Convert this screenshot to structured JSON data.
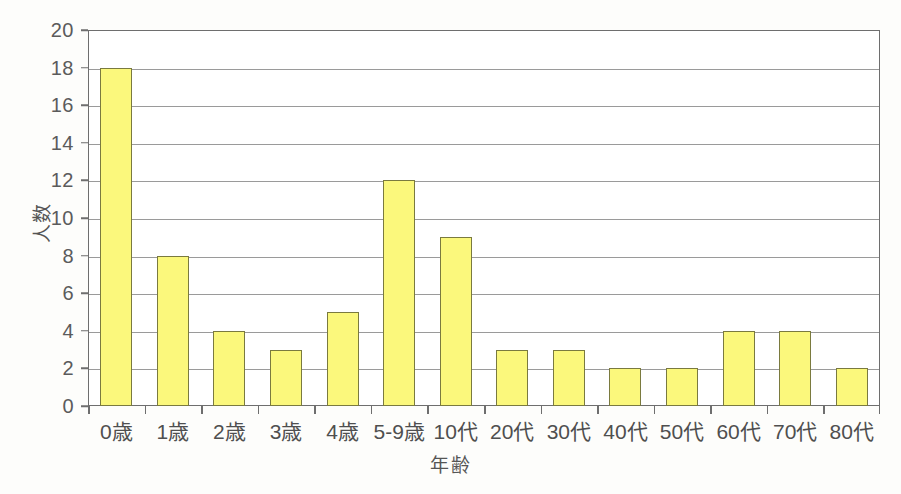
{
  "chart_data": {
    "type": "bar",
    "title": "",
    "xlabel": "年齢",
    "ylabel": "人数",
    "categories": [
      "0歳",
      "1歳",
      "2歳",
      "3歳",
      "4歳",
      "5-9歳",
      "10代",
      "20代",
      "30代",
      "40代",
      "50代",
      "60代",
      "70代",
      "80代"
    ],
    "values": [
      18,
      8,
      4,
      3,
      5,
      12,
      9,
      3,
      3,
      2,
      2,
      4,
      4,
      2
    ],
    "ylim": [
      0,
      20
    ],
    "ytick_values": [
      0,
      2,
      4,
      6,
      8,
      10,
      12,
      14,
      16,
      18,
      20
    ],
    "ytick_labels": [
      "0",
      "2",
      "4",
      "6",
      "8",
      "10",
      "12",
      "14",
      "16",
      "18",
      "20"
    ],
    "grid": true,
    "grid_axis": "y",
    "legend": false,
    "legend_position": "none",
    "bar_fill_color": "#fbf87c",
    "bar_border_color": "#7a7a3f",
    "gridline_color": "#9a9a9a",
    "axis_color": "#6e6e6e",
    "plot_background": "#ffffff",
    "figure_background": "#fdfdfb"
  }
}
